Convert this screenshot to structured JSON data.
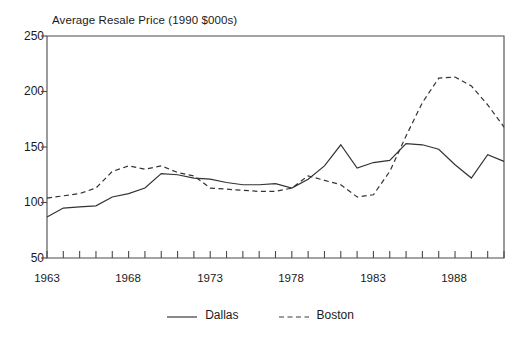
{
  "chart_data": {
    "type": "line",
    "title": "Average Resale Price (1990 $000s)",
    "xlabel": "",
    "ylabel": "",
    "ylim": [
      50,
      250
    ],
    "yticks": [
      50,
      100,
      150,
      200,
      250
    ],
    "xlim": [
      1963,
      1991
    ],
    "xticks_labeled": [
      1963,
      1968,
      1973,
      1978,
      1983,
      1988
    ],
    "xtick_step": 1,
    "grid": false,
    "legend_position": "bottom-center",
    "x": [
      1963,
      1964,
      1965,
      1966,
      1967,
      1968,
      1969,
      1970,
      1971,
      1972,
      1973,
      1974,
      1975,
      1976,
      1977,
      1978,
      1979,
      1980,
      1981,
      1982,
      1983,
      1984,
      1985,
      1986,
      1987,
      1988,
      1989,
      1990,
      1991
    ],
    "series": [
      {
        "name": "Dallas",
        "style": "solid",
        "color": "#333333",
        "values": [
          87,
          95,
          96,
          97,
          105,
          108,
          113,
          126,
          125,
          122,
          121,
          118,
          116,
          116,
          117,
          113,
          121,
          133,
          152,
          131,
          136,
          138,
          153,
          152,
          148,
          134,
          122,
          143,
          137
        ]
      },
      {
        "name": "Boston",
        "style": "dashed",
        "color": "#333333",
        "values": [
          104,
          106,
          108,
          113,
          128,
          133,
          130,
          133,
          127,
          124,
          113,
          112,
          111,
          110,
          110,
          113,
          124,
          120,
          116,
          105,
          107,
          128,
          160,
          190,
          212,
          213,
          205,
          188,
          168
        ]
      }
    ]
  },
  "legend": {
    "items": [
      {
        "label": "Dallas",
        "style": "solid"
      },
      {
        "label": "Boston",
        "style": "dashed"
      }
    ]
  },
  "axes": {
    "y_labels": [
      "250",
      "200",
      "150",
      "100",
      "50"
    ],
    "x_labels": [
      "1963",
      "1968",
      "1973",
      "1978",
      "1983",
      "1988"
    ]
  }
}
